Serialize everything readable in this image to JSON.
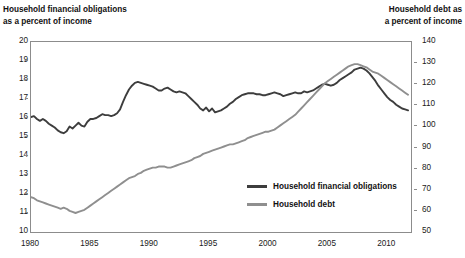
{
  "left_axis": {
    "title": "Household financial obligations\nas a percent of income",
    "ticks": [
      "20",
      "19",
      "18",
      "17",
      "16",
      "15",
      "14",
      "13",
      "12",
      "11",
      "10"
    ],
    "min": 10,
    "max": 20
  },
  "right_axis": {
    "title": "Household debt as\na percent of income",
    "ticks": [
      "140",
      "130",
      "120",
      "110",
      "100",
      "90",
      "80",
      "70",
      "60",
      "50"
    ],
    "min": 50,
    "max": 140
  },
  "x_axis": {
    "ticks": [
      "1980",
      "1985",
      "1990",
      "1995",
      "2000",
      "2005",
      "2010"
    ],
    "min": 1980,
    "max": 2012
  },
  "legend": {
    "items": [
      {
        "label": "Household financial obligations",
        "color": "#3d3d3d"
      },
      {
        "label": "Household debt",
        "color": "#8f8f8f"
      }
    ]
  },
  "colors": {
    "obligations": "#3d3d3d",
    "debt": "#8f8f8f",
    "frame": "#8c8c8c",
    "text": "#111111",
    "background": "#ffffff"
  },
  "chart_data": {
    "type": "line",
    "title": "",
    "xlabel": "",
    "ylabel": "Household financial obligations as a percent of income",
    "ylabel_right": "Household debt as a percent of income",
    "grid": false,
    "legend_position": "inside-center-bottom",
    "xlim": [
      1980,
      2012
    ],
    "ylim": [
      10,
      20
    ],
    "ylim_right": [
      50,
      140
    ],
    "x": [
      1980.0,
      1980.25,
      1980.5,
      1980.75,
      1981.0,
      1981.25,
      1981.5,
      1981.75,
      1982.0,
      1982.25,
      1982.5,
      1982.75,
      1983.0,
      1983.25,
      1983.5,
      1983.75,
      1984.0,
      1984.25,
      1984.5,
      1984.75,
      1985.0,
      1985.25,
      1985.5,
      1985.75,
      1986.0,
      1986.25,
      1986.5,
      1986.75,
      1987.0,
      1987.25,
      1987.5,
      1987.75,
      1988.0,
      1988.25,
      1988.5,
      1988.75,
      1989.0,
      1989.25,
      1989.5,
      1989.75,
      1990.0,
      1990.25,
      1990.5,
      1990.75,
      1991.0,
      1991.25,
      1991.5,
      1991.75,
      1992.0,
      1992.25,
      1992.5,
      1992.75,
      1993.0,
      1993.25,
      1993.5,
      1993.75,
      1994.0,
      1994.25,
      1994.5,
      1994.75,
      1995.0,
      1995.25,
      1995.5,
      1995.75,
      1996.0,
      1996.25,
      1996.5,
      1996.75,
      1997.0,
      1997.25,
      1997.5,
      1997.75,
      1998.0,
      1998.25,
      1998.5,
      1998.75,
      1999.0,
      1999.25,
      1999.5,
      1999.75,
      2000.0,
      2000.25,
      2000.5,
      2000.75,
      2001.0,
      2001.25,
      2001.5,
      2001.75,
      2002.0,
      2002.25,
      2002.5,
      2002.75,
      2003.0,
      2003.25,
      2003.5,
      2003.75,
      2004.0,
      2004.25,
      2004.5,
      2004.75,
      2005.0,
      2005.25,
      2005.5,
      2005.75,
      2006.0,
      2006.25,
      2006.5,
      2006.75,
      2007.0,
      2007.25,
      2007.5,
      2007.75,
      2008.0,
      2008.25,
      2008.5,
      2008.75,
      2009.0,
      2009.25,
      2009.5,
      2009.75,
      2010.0,
      2010.25,
      2010.5,
      2010.75,
      2011.0,
      2011.25,
      2011.5,
      2011.75
    ],
    "series": [
      {
        "name": "Household financial obligations",
        "axis": "left",
        "color": "#3d3d3d",
        "unit": "percent of income",
        "values": [
          16.05,
          16.1,
          15.95,
          15.85,
          15.95,
          15.85,
          15.7,
          15.6,
          15.5,
          15.35,
          15.25,
          15.2,
          15.3,
          15.55,
          15.45,
          15.6,
          15.75,
          15.6,
          15.55,
          15.8,
          15.95,
          15.95,
          16.0,
          16.1,
          16.2,
          16.15,
          16.15,
          16.1,
          16.15,
          16.25,
          16.45,
          16.85,
          17.2,
          17.5,
          17.7,
          17.85,
          17.9,
          17.85,
          17.8,
          17.75,
          17.7,
          17.65,
          17.55,
          17.45,
          17.45,
          17.55,
          17.6,
          17.5,
          17.4,
          17.35,
          17.4,
          17.35,
          17.3,
          17.15,
          17.0,
          16.85,
          16.7,
          16.5,
          16.4,
          16.55,
          16.35,
          16.5,
          16.3,
          16.35,
          16.4,
          16.5,
          16.6,
          16.75,
          16.85,
          17.0,
          17.1,
          17.2,
          17.25,
          17.3,
          17.3,
          17.3,
          17.25,
          17.25,
          17.2,
          17.2,
          17.25,
          17.3,
          17.35,
          17.3,
          17.25,
          17.15,
          17.2,
          17.25,
          17.3,
          17.35,
          17.3,
          17.3,
          17.4,
          17.35,
          17.4,
          17.45,
          17.55,
          17.65,
          17.75,
          17.8,
          17.75,
          17.7,
          17.75,
          17.85,
          18.0,
          18.1,
          18.2,
          18.3,
          18.4,
          18.55,
          18.6,
          18.65,
          18.6,
          18.5,
          18.35,
          18.15,
          17.95,
          17.7,
          17.5,
          17.3,
          17.1,
          16.95,
          16.85,
          16.7,
          16.6,
          16.5,
          16.45,
          16.4
        ]
      },
      {
        "name": "Household debt",
        "axis": "right",
        "color": "#8f8f8f",
        "unit": "percent of income",
        "values": [
          66.5,
          66.0,
          65.0,
          64.5,
          64.0,
          63.5,
          63.0,
          62.5,
          62.0,
          61.5,
          61.0,
          61.5,
          61.0,
          60.0,
          59.5,
          59.0,
          59.5,
          60.0,
          60.5,
          61.5,
          62.5,
          63.5,
          64.5,
          65.5,
          66.5,
          67.5,
          68.5,
          69.5,
          70.5,
          71.5,
          72.5,
          73.5,
          74.5,
          75.5,
          76.0,
          76.5,
          77.5,
          78.0,
          79.0,
          79.5,
          80.0,
          80.5,
          80.5,
          81.0,
          81.0,
          81.0,
          80.5,
          80.5,
          81.0,
          81.5,
          82.0,
          82.5,
          83.0,
          83.5,
          84.0,
          85.0,
          85.5,
          86.0,
          87.0,
          87.5,
          88.0,
          88.5,
          89.0,
          89.5,
          90.0,
          90.5,
          91.0,
          91.5,
          91.5,
          92.0,
          92.5,
          93.0,
          93.5,
          94.5,
          95.0,
          95.5,
          96.0,
          96.5,
          97.0,
          97.5,
          97.5,
          98.0,
          98.5,
          99.5,
          100.5,
          101.5,
          102.5,
          103.5,
          104.5,
          105.5,
          107.0,
          108.5,
          110.0,
          111.5,
          113.0,
          114.5,
          116.0,
          117.5,
          119.0,
          120.5,
          121.5,
          122.5,
          123.5,
          124.5,
          125.5,
          126.5,
          127.5,
          128.5,
          129.0,
          129.5,
          129.5,
          129.0,
          128.5,
          128.0,
          127.0,
          126.0,
          125.5,
          125.0,
          124.0,
          123.0,
          122.0,
          121.0,
          120.0,
          119.0,
          118.0,
          117.0,
          116.0,
          115.0
        ]
      }
    ]
  }
}
